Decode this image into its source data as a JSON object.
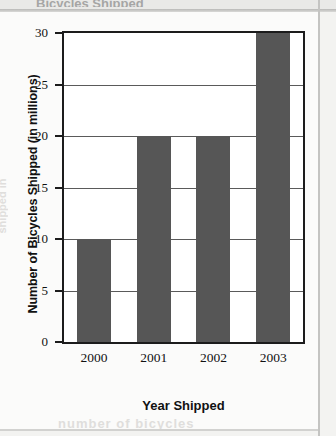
{
  "page": {
    "title_sliver": "Bicycles Shipped",
    "bleed_bottom": "number of bicycles",
    "bleed_left": "shipped in"
  },
  "chart_data": {
    "type": "bar",
    "title": "",
    "categories": [
      "2000",
      "2001",
      "2002",
      "2003"
    ],
    "values": [
      10,
      20,
      20,
      30
    ],
    "xlabel": "Year Shipped",
    "ylabel": "Number of Bicycles Shipped (in millions)",
    "ylim": [
      0,
      30
    ],
    "yticks": [
      0,
      5,
      10,
      15,
      20,
      25,
      30
    ],
    "ytick_labels": [
      "0",
      "5",
      "10",
      "15",
      "20",
      "25",
      "30"
    ],
    "grid": true,
    "legend": null,
    "bar_color": "#565656",
    "axis_color": "#1c1c1c",
    "plot_background": "#ffffff"
  }
}
